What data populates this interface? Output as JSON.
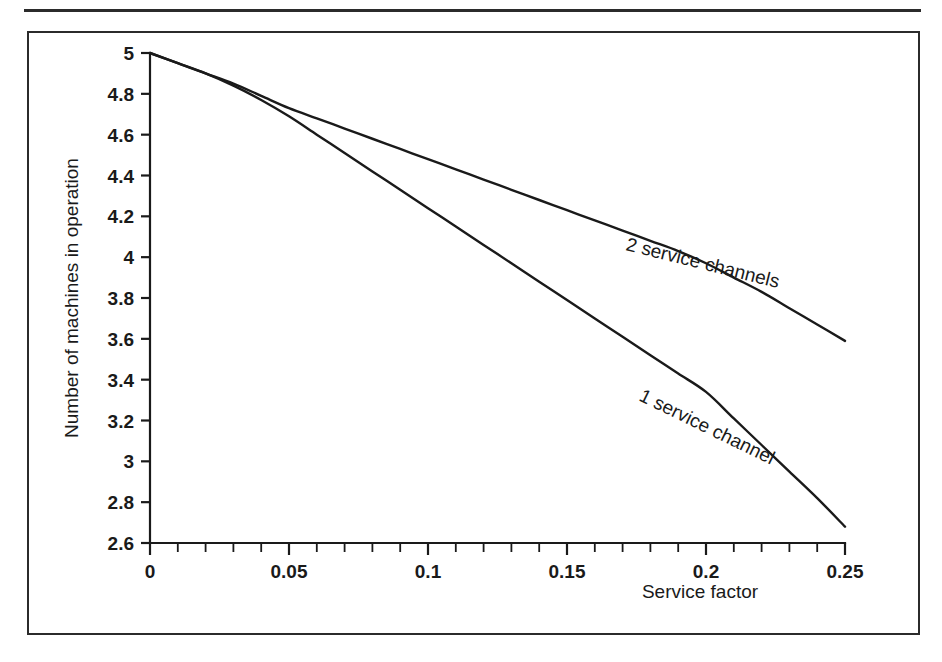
{
  "figure": {
    "frame_border_color": "#2b2b2b",
    "background_color": "#ffffff",
    "ink_color": "#1a1a1a"
  },
  "chart_data": {
    "type": "line",
    "title": "",
    "xlabel": "Service factor",
    "ylabel": "Number of machines in operation",
    "xlim": [
      0,
      0.25
    ],
    "ylim": [
      2.6,
      5
    ],
    "grid": false,
    "legend": "inline-curve-labels",
    "x_ticks": [
      0,
      0.05,
      0.1,
      0.15,
      0.2,
      0.25
    ],
    "x_tick_labels": [
      "0",
      "0.05",
      "0.1",
      "0.15",
      "0.2",
      "0.25"
    ],
    "x_minor_tick_step": 0.01,
    "y_ticks": [
      2.6,
      2.8,
      3,
      3.2,
      3.4,
      3.6,
      3.8,
      4,
      4.2,
      4.4,
      4.6,
      4.8,
      5
    ],
    "y_tick_labels": [
      "2.6",
      "2.8",
      "3",
      "3.2",
      "3.4",
      "3.6",
      "3.8",
      "4",
      "4.2",
      "4.4",
      "4.6",
      "4.8",
      "5"
    ],
    "series": [
      {
        "name": "2 service channels",
        "label_rotation_deg": 14,
        "x": [
          0,
          0.01,
          0.02,
          0.03,
          0.04,
          0.05,
          0.06,
          0.07,
          0.08,
          0.09,
          0.1,
          0.11,
          0.12,
          0.13,
          0.14,
          0.15,
          0.16,
          0.17,
          0.18,
          0.19,
          0.2,
          0.21,
          0.22,
          0.23,
          0.24,
          0.25
        ],
        "values": [
          5.0,
          4.95,
          4.9,
          4.85,
          4.79,
          4.73,
          4.68,
          4.63,
          4.58,
          4.53,
          4.48,
          4.43,
          4.38,
          4.33,
          4.28,
          4.23,
          4.18,
          4.13,
          4.08,
          4.03,
          3.97,
          3.9,
          3.83,
          3.75,
          3.67,
          3.59
        ]
      },
      {
        "name": "1 service channel",
        "label_rotation_deg": 26,
        "x": [
          0,
          0.01,
          0.02,
          0.03,
          0.04,
          0.05,
          0.06,
          0.07,
          0.08,
          0.09,
          0.1,
          0.11,
          0.12,
          0.13,
          0.14,
          0.15,
          0.16,
          0.17,
          0.18,
          0.19,
          0.2,
          0.21,
          0.22,
          0.23,
          0.24,
          0.25
        ],
        "values": [
          5.0,
          4.95,
          4.9,
          4.84,
          4.77,
          4.69,
          4.6,
          4.51,
          4.42,
          4.33,
          4.24,
          4.15,
          4.06,
          3.97,
          3.88,
          3.79,
          3.7,
          3.61,
          3.52,
          3.43,
          3.34,
          3.21,
          3.08,
          2.95,
          2.82,
          2.68
        ]
      }
    ]
  }
}
